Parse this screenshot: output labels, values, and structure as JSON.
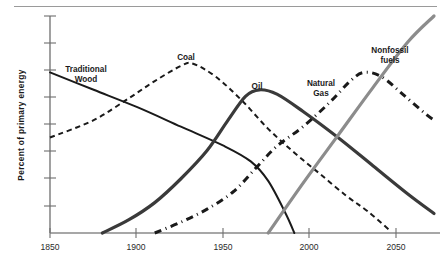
{
  "chart_data": {
    "type": "line",
    "title": "",
    "subtitle": "",
    "xlabel": "",
    "ylabel": "Percent  of  primary  energy",
    "xlim": [
      1850,
      2070
    ],
    "ylim": [
      0,
      100
    ],
    "grid": false,
    "legend_position": "inline-annotations",
    "x_ticks": [
      "1850",
      "1900",
      "1950",
      "2000",
      "2050"
    ],
    "x_tick_values": [
      1850,
      1900,
      1950,
      2000,
      2050
    ],
    "y_ticks": [],
    "y_tick_count": 8,
    "y_axis_labeled": false,
    "annotations": [
      {
        "text_line1": "Traditional",
        "text_line2": "Wood",
        "x": 1880,
        "y": 78
      },
      {
        "text_line1": "Coal",
        "text_line2": "",
        "x": 1928,
        "y": 88
      },
      {
        "text_line1": "Oil",
        "text_line2": "",
        "x": 1971,
        "y": 72
      },
      {
        "text_line1": "Natural",
        "text_line2": "Gas",
        "x": 2005,
        "y": 72
      },
      {
        "text_line1": "Nonfossil",
        "text_line2": "fuels",
        "x": 2044,
        "y": 93
      }
    ],
    "series": [
      {
        "name": "Traditional Wood",
        "style": "solid",
        "color": "#1a1a1a",
        "width": 2.0,
        "x": [
          1850,
          1875,
          1900,
          1925,
          1950,
          1965,
          1975,
          1985,
          1990
        ],
        "values": [
          74,
          66,
          58,
          49,
          40,
          33,
          24,
          9,
          0
        ]
      },
      {
        "name": "Coal",
        "style": "dashed",
        "color": "#1a1a1a",
        "width": 2.0,
        "x": [
          1850,
          1875,
          1895,
          1910,
          1925,
          1932,
          1945,
          1960,
          1975,
          1990,
          2005,
          2020,
          2032,
          2045
        ],
        "values": [
          44,
          52,
          62,
          70,
          77,
          78,
          72,
          61,
          48,
          37,
          27,
          17,
          10,
          1
        ]
      },
      {
        "name": "Oil",
        "style": "solid",
        "color": "#3a3a3a",
        "width": 3.2,
        "x": [
          1880,
          1895,
          1910,
          1925,
          1940,
          1952,
          1962,
          1970,
          1980,
          1995,
          2015,
          2035,
          2055,
          2070
        ],
        "values": [
          0,
          6,
          14,
          25,
          38,
          52,
          63,
          66,
          64,
          56,
          44,
          31,
          18,
          9
        ]
      },
      {
        "name": "Natural Gas",
        "style": "dashdot",
        "color": "#1a1a1a",
        "width": 3.0,
        "x": [
          1910,
          1925,
          1940,
          1955,
          1968,
          1980,
          1995,
          2010,
          2022,
          2030,
          2040,
          2052,
          2065,
          2070
        ],
        "values": [
          0,
          5,
          11,
          19,
          30,
          40,
          49,
          60,
          70,
          74,
          72,
          64,
          55,
          52
        ]
      },
      {
        "name": "Nonfossil fuels",
        "style": "solid",
        "color": "#8c8c8c",
        "width": 3.2,
        "x": [
          1975,
          1995,
          2015,
          2035,
          2055,
          2070
        ],
        "values": [
          0,
          23,
          45,
          67,
          88,
          100
        ]
      }
    ]
  },
  "axis": {
    "y_title": "Percent  of  primary  energy"
  },
  "labels": {
    "traditional_wood_l1": "Traditional",
    "traditional_wood_l2": "Wood",
    "coal": "Coal",
    "oil": "Oil",
    "natural_gas_l1": "Natural",
    "natural_gas_l2": "Gas",
    "nonfossil_l1": "Nonfossil",
    "nonfossil_l2": "fuels",
    "tick_1850": "1850",
    "tick_1900": "1900",
    "tick_1950": "1950",
    "tick_2000": "2000",
    "tick_2050": "2050"
  },
  "colors": {
    "wood": "#1a1a1a",
    "coal": "#1a1a1a",
    "oil": "#3a3a3a",
    "gas": "#1a1a1a",
    "nonfossil": "#8c8c8c",
    "axis": "#6e6e6e",
    "top_rule": "#9a9a9a",
    "background": "#ffffff"
  }
}
